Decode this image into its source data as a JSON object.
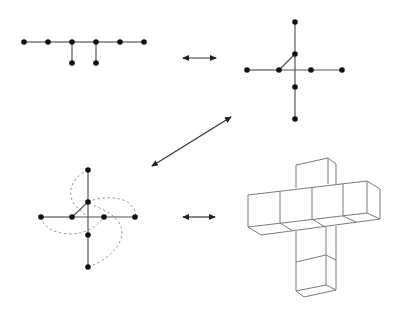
{
  "diagram": {
    "title": "",
    "colors": {
      "edge": "#555555",
      "node": "#111111",
      "dashed": "#999999",
      "cube": "#777777",
      "arrow": "#333333"
    },
    "panels": [
      {
        "id": "linear-tree",
        "nodes": [
          [
            24,
            42
          ],
          [
            48,
            42
          ],
          [
            72,
            42
          ],
          [
            96,
            42
          ],
          [
            120,
            42
          ],
          [
            144,
            42
          ],
          [
            72,
            63
          ],
          [
            96,
            63
          ]
        ],
        "edges": [
          [
            0,
            1
          ],
          [
            1,
            2
          ],
          [
            2,
            3
          ],
          [
            3,
            4
          ],
          [
            4,
            5
          ],
          [
            2,
            6
          ],
          [
            3,
            7
          ]
        ]
      },
      {
        "id": "cross-tree",
        "nodes": [
          [
            295,
            22
          ],
          [
            295,
            54
          ],
          [
            295,
            87
          ],
          [
            295,
            119
          ],
          [
            247,
            70
          ],
          [
            279,
            70
          ],
          [
            311,
            70
          ],
          [
            342,
            70
          ]
        ],
        "edges": [
          [
            0,
            1
          ],
          [
            1,
            2
          ],
          [
            2,
            3
          ],
          [
            4,
            5
          ],
          [
            5,
            7
          ],
          [
            5,
            1
          ]
        ]
      },
      {
        "id": "pinwheel-tree",
        "nodes": [
          [
            88,
            170
          ],
          [
            88,
            202
          ],
          [
            88,
            235
          ],
          [
            88,
            267
          ],
          [
            41,
            217
          ],
          [
            72,
            217
          ],
          [
            104,
            217
          ],
          [
            135,
            217
          ]
        ],
        "edges": [
          [
            0,
            1
          ],
          [
            1,
            2
          ],
          [
            2,
            3
          ],
          [
            4,
            5
          ],
          [
            5,
            7
          ],
          [
            5,
            1
          ]
        ]
      },
      {
        "id": "cube-net",
        "description": "3D polycube cross shape"
      }
    ],
    "arrows": [
      {
        "id": "arrow-top",
        "x1": 183,
        "y1": 58,
        "x2": 216,
        "y2": 58
      },
      {
        "id": "arrow-diagonal",
        "x1": 231,
        "y1": 117,
        "x2": 152,
        "y2": 166
      },
      {
        "id": "arrow-bottom",
        "x1": 183,
        "y1": 217,
        "x2": 215,
        "y2": 217
      }
    ]
  }
}
